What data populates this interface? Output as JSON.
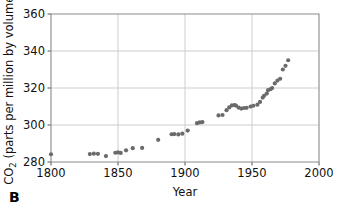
{
  "panel": {
    "label": "B"
  },
  "chart_data": {
    "type": "scatter",
    "title": "",
    "subtitle": "",
    "xlabel": "Year",
    "ylabel": "CO2 (parts per million by volume)",
    "ylabel_prefix": "CO",
    "ylabel_subscript": "2",
    "ylabel_suffix": " (parts per million by volume)",
    "xlim": [
      1800,
      2000
    ],
    "ylim": [
      280,
      360
    ],
    "xticks": [
      1800,
      1850,
      1900,
      1950,
      2000
    ],
    "xtick_labels": [
      "1800",
      "1850",
      "1900",
      "1950",
      "2000"
    ],
    "yticks": [
      280,
      300,
      320,
      340,
      360
    ],
    "ytick_labels": [
      "280",
      "300",
      "320",
      "340",
      "360"
    ],
    "grid": true,
    "grid_axis": "both",
    "legend": null,
    "marker": "circle",
    "marker_color": "#6a6a6a",
    "marker_size": 4.2,
    "series": [
      {
        "name": "Atmospheric CO2",
        "x": [
          1800,
          1829,
          1832,
          1835,
          1841,
          1848,
          1850,
          1852,
          1856,
          1861,
          1868,
          1880,
          1890,
          1892,
          1895,
          1898,
          1902,
          1909,
          1911,
          1913,
          1925,
          1928,
          1931,
          1933,
          1935,
          1937,
          1938,
          1940,
          1942,
          1944,
          1946,
          1949,
          1951,
          1954,
          1956,
          1958,
          1959,
          1961,
          1962,
          1964,
          1965,
          1967,
          1969,
          1971,
          1973,
          1975,
          1977
        ],
        "y": [
          284.2,
          284.3,
          284.5,
          284.4,
          283.2,
          285.0,
          285.2,
          284.9,
          286.3,
          287.5,
          287.6,
          292.0,
          295.0,
          295.1,
          294.9,
          295.3,
          297.0,
          301.0,
          301.4,
          301.6,
          305.2,
          305.4,
          308.0,
          309.5,
          310.6,
          310.8,
          310.5,
          309.4,
          308.9,
          309.2,
          309.3,
          310.0,
          310.4,
          311.0,
          312.5,
          314.8,
          315.8,
          317.0,
          318.8,
          319.4,
          320.0,
          322.5,
          324.0,
          325.0,
          330.0,
          332.0,
          335.0
        ]
      }
    ]
  }
}
